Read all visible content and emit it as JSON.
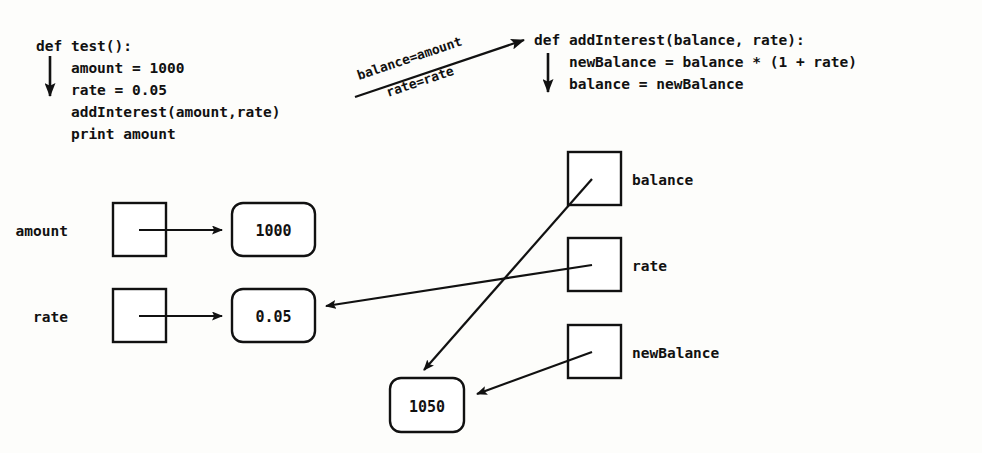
{
  "diagram": {
    "colors": {
      "background": "#fdfdfb",
      "ink": "#111111",
      "box_fill": "#ffffff"
    },
    "code_blocks": [
      {
        "name": "caller",
        "lines": [
          "def test():",
          "    amount = 1000",
          "    rate = 0.05",
          "    addInterest(amount,rate)",
          "    print amount"
        ]
      },
      {
        "name": "callee",
        "lines": [
          "def addInterest(balance, rate):",
          "    newBalance = balance * (1 + rate)",
          "    balance = newBalance"
        ]
      }
    ],
    "call_edge": {
      "label_top": "balance=amount",
      "label_bottom": "rate=rate"
    },
    "caller_frame": {
      "variables": [
        {
          "name": "amount",
          "value": "1000"
        },
        {
          "name": "rate",
          "value": "0.05"
        }
      ]
    },
    "callee_frame": {
      "variables": [
        {
          "name": "balance",
          "value": "1050"
        },
        {
          "name": "rate",
          "value": "0.05"
        },
        {
          "name": "newBalance",
          "value": "1050"
        }
      ],
      "shared_value": "1050"
    }
  }
}
